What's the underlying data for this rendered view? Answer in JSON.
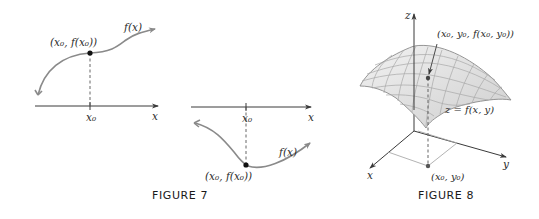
{
  "figures": [
    {
      "id": "figure-7",
      "caption": "FIGURE 7",
      "panels": [
        {
          "name": "local-max",
          "curve_label": "f(x)",
          "point_label": "(x₀, f(x₀))",
          "tick_label": "x₀",
          "axis_label": "x"
        },
        {
          "name": "local-min",
          "curve_label": "f(x)",
          "point_label": "(x₀, f(x₀))",
          "tick_label": "x₀",
          "axis_label": "x"
        }
      ]
    },
    {
      "id": "figure-8",
      "caption": "FIGURE 8",
      "surface_label": "z = f(x, y)",
      "point_label": "(x₀, y₀, f(x₀, y₀))",
      "base_point_label": "(x₀, y₀)",
      "axes": {
        "x": "x",
        "y": "y",
        "z": "z"
      }
    }
  ],
  "colors": {
    "curve": "#8a8a8a",
    "axis": "#3a3a3a",
    "surface_fill": "#e6e6e6",
    "surface_grid": "#9a9a9a",
    "point": "#111111"
  }
}
